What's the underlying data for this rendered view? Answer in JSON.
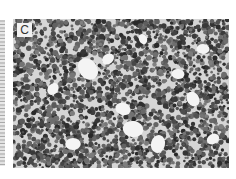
{
  "figure": {
    "panel_label": "C",
    "colors": {
      "background": "#ffffff",
      "tissue_base": "#d6d6d6",
      "nuclei": "#3a3a3a",
      "clear_spaces": "#f4f4f4",
      "label_box": "#f2f2f2"
    }
  }
}
